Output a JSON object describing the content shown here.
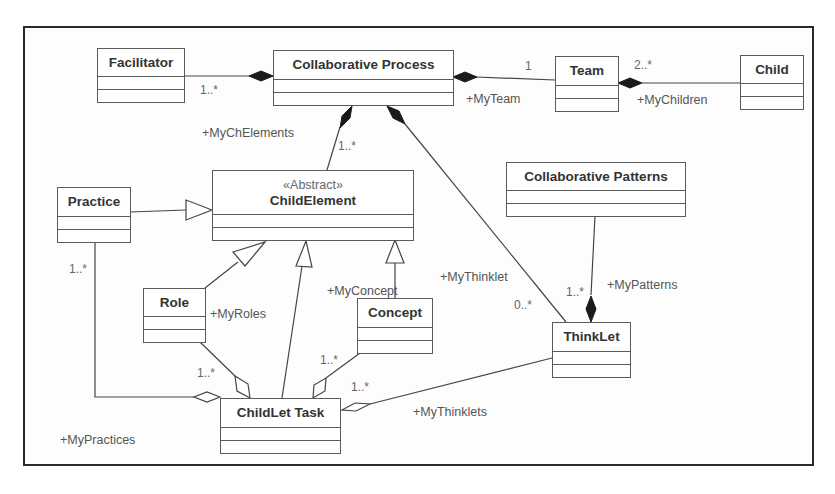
{
  "diagram": {
    "type": "UML class diagram",
    "classes": {
      "facilitator": {
        "name": "Facilitator"
      },
      "collaborative_process": {
        "name": "Collaborative Process"
      },
      "team": {
        "name": "Team"
      },
      "child": {
        "name": "Child"
      },
      "child_element": {
        "stereotype": "«Abstract»",
        "name": "ChildElement"
      },
      "practice": {
        "name": "Practice"
      },
      "collaborative_patterns": {
        "name": "Collaborative Patterns"
      },
      "role": {
        "name": "Role"
      },
      "concept": {
        "name": "Concept"
      },
      "thinklet": {
        "name": "ThinkLet"
      },
      "childlet_task": {
        "name": "ChildLet Task"
      }
    },
    "relationships": {
      "facilitator_process": {
        "kind": "composition",
        "from": "Collaborative Process",
        "to": "Facilitator",
        "multiplicity": "1..*"
      },
      "process_team": {
        "kind": "composition",
        "from": "Collaborative Process",
        "to": "Team",
        "multiplicity": "1",
        "role": "+MyTeam"
      },
      "team_child": {
        "kind": "composition",
        "from": "Team",
        "to": "Child",
        "multiplicity": "2..*",
        "role": "+MyChildren"
      },
      "process_childelement": {
        "kind": "composition",
        "from": "Collaborative Process",
        "to": "ChildElement",
        "multiplicity": "1..*",
        "role": "+MyChElements"
      },
      "process_thinklet": {
        "kind": "composition",
        "from": "Collaborative Process",
        "to": "ThinkLet",
        "multiplicity": "0..*",
        "role": "+MyThinklet"
      },
      "patterns_thinklet": {
        "kind": "composition",
        "from": "ThinkLet",
        "to": "Collaborative Patterns",
        "multiplicity": "1..*",
        "role": "+MyPatterns"
      },
      "practice_gen": {
        "kind": "generalization",
        "from": "Practice",
        "to": "ChildElement"
      },
      "role_gen": {
        "kind": "generalization",
        "from": "Role",
        "to": "ChildElement"
      },
      "task_gen": {
        "kind": "generalization",
        "from": "ChildLet Task",
        "to": "ChildElement"
      },
      "concept_gen": {
        "kind": "generalization",
        "from": "Concept",
        "to": "ChildElement",
        "role": "+MyConcept"
      },
      "task_practice": {
        "kind": "aggregation",
        "from": "ChildLet Task",
        "to": "Practice",
        "multiplicity": "1..*",
        "role": "+MyPractices"
      },
      "task_role": {
        "kind": "aggregation",
        "from": "ChildLet Task",
        "to": "Role",
        "multiplicity": "1..*",
        "role": "+MyRoles"
      },
      "task_concept": {
        "kind": "aggregation",
        "from": "ChildLet Task",
        "to": "Concept",
        "multiplicity": "1..*"
      },
      "task_thinklet": {
        "kind": "aggregation",
        "from": "ChildLet Task",
        "to": "ThinkLet",
        "multiplicity": "1..*",
        "role": "+MyThinklets"
      }
    },
    "labels": {
      "my_team": "+MyTeam",
      "my_children": "+MyChildren",
      "my_ch_elements": "+MyChElements",
      "my_thinklet": "+MyThinklet",
      "my_patterns": "+MyPatterns",
      "my_concept": "+MyConcept",
      "my_roles": "+MyRoles",
      "my_thinklets": "+MyThinklets",
      "my_practices": "+MyPractices"
    },
    "multiplicities": {
      "facilitator": "1..*",
      "team_one": "1",
      "children": "2..*",
      "ch_elements": "1..*",
      "thinklet_zero_many": "0..*",
      "patterns": "1..*",
      "practice": "1..*",
      "role": "1..*",
      "concept": "1..*",
      "thinklets": "1..*"
    },
    "colors": {
      "line": "#444444",
      "frame": "#2a2a2a",
      "text": "#333333"
    }
  }
}
